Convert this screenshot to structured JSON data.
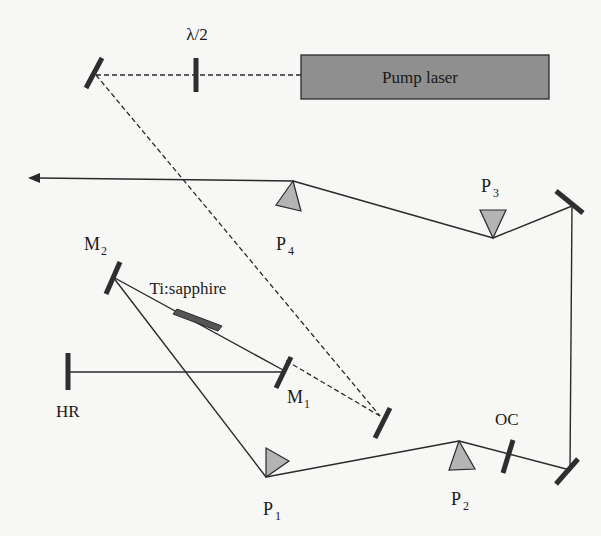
{
  "labels": {
    "half_wave_plate": "λ/2",
    "pump_laser": "Pump laser",
    "mirror_m1": "M",
    "mirror_m1_sub": "1",
    "mirror_m2": "M",
    "mirror_m2_sub": "2",
    "crystal": "Ti:sapphire",
    "high_reflector": "HR",
    "output_coupler": "OC",
    "prism_p1": "P",
    "prism_p1_sub": "1",
    "prism_p2": "P",
    "prism_p2_sub": "2",
    "prism_p3": "P",
    "prism_p3_sub": "3",
    "prism_p4": "P",
    "prism_p4_sub": "4"
  },
  "colors": {
    "pump_laser_fill": "#8f8f8f",
    "prism_fill": "#b4b4b4",
    "crystal_fill": "#555555",
    "line": "#2a2a2a",
    "background": "#f7f7f5"
  }
}
